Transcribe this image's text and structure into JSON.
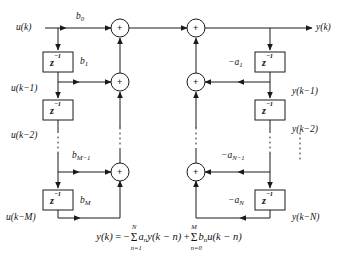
{
  "figure": {
    "background_color": "#ffffff",
    "line_color": "#1a1a1a"
  },
  "signals": {
    "input": "u(k)",
    "input_d1": "u(k−1)",
    "input_d2": "u(k−2)",
    "input_dM": "u(k−M)",
    "output": "y(k)",
    "output_d1": "y(k−1)",
    "output_d2": "y(k−2)",
    "output_dN": "y(k−N)"
  },
  "delay_blocks": {
    "label_z": "z",
    "label_exp": "−1",
    "count_left": 3,
    "count_right": 3
  },
  "feedforward_gains": {
    "b0": "b",
    "b0_sub": "0",
    "b1": "b",
    "b1_sub": "1",
    "bM1": "b",
    "bM1_sub": "M−1",
    "bM": "b",
    "bM_sub": "M"
  },
  "feedback_gains": {
    "a1": "−a",
    "a1_sub": "1",
    "aN1": "−a",
    "aN1_sub": "N−1",
    "aN": "−a",
    "aN_sub": "N"
  },
  "adders": {
    "symbol": "+",
    "count": 6
  },
  "equation": {
    "lhs": "y(k)",
    "equals": "=",
    "minus": "−",
    "sigma": "Σ",
    "sum1_upper": "N",
    "sum1_lower": "n=1",
    "sum1_coeff": "a",
    "sum1_coeff_sub": "n",
    "sum1_term": "y(k − n)",
    "plus": "+",
    "sum2_upper": "M",
    "sum2_lower": "n=0",
    "sum2_coeff": "b",
    "sum2_coeff_sub": "n",
    "sum2_term": "u(k − n)",
    "full_text": "y(k) = −Σ(n=1..N) a_n y(k−n) + Σ(n=0..M) b_n u(k−n)"
  }
}
